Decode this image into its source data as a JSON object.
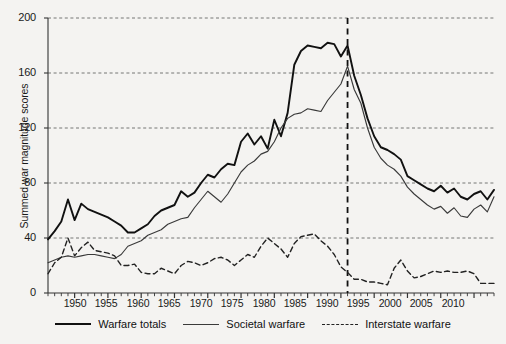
{
  "chart_data": {
    "type": "line",
    "title": "",
    "xlabel": "",
    "ylabel": "Summed war magnitude scores",
    "xlim": [
      1946,
      2013
    ],
    "ylim": [
      0,
      200
    ],
    "yticks": [
      0,
      40,
      80,
      120,
      160,
      200
    ],
    "xticks": [
      1950,
      1955,
      1960,
      1965,
      1970,
      1975,
      1980,
      1985,
      1990,
      1995,
      2000,
      2005,
      2010
    ],
    "grid": "horizontal-dashed",
    "legend_position": "bottom",
    "annotations": [
      {
        "type": "vertical-dashed-line",
        "x": 1991,
        "label": ""
      }
    ],
    "x": [
      1946,
      1947,
      1948,
      1949,
      1950,
      1951,
      1952,
      1953,
      1954,
      1955,
      1956,
      1957,
      1958,
      1959,
      1960,
      1961,
      1962,
      1963,
      1964,
      1965,
      1966,
      1967,
      1968,
      1969,
      1970,
      1971,
      1972,
      1973,
      1974,
      1975,
      1976,
      1977,
      1978,
      1979,
      1980,
      1981,
      1982,
      1983,
      1984,
      1985,
      1986,
      1987,
      1988,
      1989,
      1990,
      1991,
      1992,
      1993,
      1994,
      1995,
      1996,
      1997,
      1998,
      1999,
      2000,
      2001,
      2002,
      2003,
      2004,
      2005,
      2006,
      2007,
      2008,
      2009,
      2010,
      2011,
      2012,
      2013
    ],
    "series": [
      {
        "name": "Warfare totals",
        "style": "solid-thick",
        "color": "#111111",
        "values": [
          39,
          45,
          52,
          68,
          53,
          65,
          61,
          59,
          57,
          55,
          52,
          49,
          44,
          44,
          47,
          50,
          56,
          60,
          62,
          64,
          74,
          70,
          73,
          80,
          86,
          84,
          90,
          94,
          93,
          110,
          116,
          108,
          114,
          105,
          126,
          114,
          131,
          166,
          176,
          180,
          179,
          178,
          182,
          181,
          172,
          180,
          158,
          144,
          127,
          114,
          106,
          104,
          101,
          97,
          85,
          82,
          79,
          76,
          74,
          78,
          73,
          76,
          70,
          68,
          72,
          74,
          68,
          75
        ]
      },
      {
        "name": "Societal warfare",
        "style": "solid-thin",
        "color": "#3a3a3a",
        "values": [
          22,
          24,
          26,
          27,
          26,
          27,
          28,
          28,
          27,
          26,
          25,
          28,
          34,
          36,
          38,
          42,
          44,
          46,
          50,
          52,
          54,
          55,
          62,
          68,
          74,
          70,
          66,
          72,
          80,
          88,
          93,
          96,
          101,
          103,
          110,
          120,
          127,
          130,
          131,
          134,
          133,
          132,
          140,
          146,
          152,
          165,
          148,
          138,
          120,
          106,
          98,
          93,
          90,
          85,
          77,
          72,
          68,
          64,
          61,
          63,
          58,
          62,
          56,
          55,
          61,
          64,
          59,
          70
        ]
      },
      {
        "name": "Interstate warfare",
        "style": "dashed",
        "color": "#222222",
        "values": [
          14,
          22,
          26,
          40,
          27,
          33,
          37,
          31,
          30,
          29,
          27,
          20,
          20,
          21,
          15,
          14,
          14,
          18,
          16,
          14,
          20,
          23,
          22,
          20,
          22,
          25,
          26,
          24,
          20,
          24,
          28,
          26,
          34,
          40,
          36,
          32,
          26,
          36,
          41,
          42,
          43,
          38,
          34,
          28,
          19,
          15,
          10,
          10,
          8,
          8,
          7,
          6,
          18,
          24,
          16,
          11,
          12,
          14,
          16,
          15,
          16,
          15,
          15,
          16,
          14,
          7,
          7,
          7
        ]
      }
    ]
  },
  "axis": {
    "y_labels": [
      "200",
      "160",
      "120",
      "80",
      "40",
      "0"
    ],
    "x_labels": [
      "1950",
      "1955",
      "1960",
      "1965",
      "1970",
      "1975",
      "1980",
      "1985",
      "1990",
      "1995",
      "2000",
      "2005",
      "2010"
    ],
    "y_title": "Summed war magnitude scores"
  },
  "legend": {
    "items": [
      {
        "label": "Warfare totals",
        "marker": "solid-thick-line"
      },
      {
        "label": "Societal warfare",
        "marker": "solid-thin-line"
      },
      {
        "label": "Interstate warfare",
        "marker": "dashed-line"
      }
    ]
  }
}
